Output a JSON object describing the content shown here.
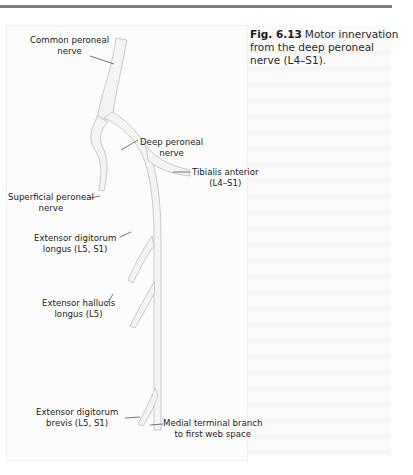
{
  "figure": {
    "number": "Fig. 6.13",
    "caption": "Motor innervation from the deep peroneal nerve (L4–S1)."
  },
  "labels": {
    "common_peroneal": [
      "Common peroneal",
      "nerve"
    ],
    "deep_peroneal": [
      "Deep peroneal",
      "nerve"
    ],
    "tibialis_anterior": [
      "Tibialis anterior",
      "(L4–S1)"
    ],
    "superficial_peroneal": [
      "Superficial peroneal",
      "nerve"
    ],
    "edl": [
      "Extensor digitorum",
      "longus (L5, S1)"
    ],
    "ehl": [
      "Extensor hallucis",
      "longus (L5)"
    ],
    "edb": [
      "Extensor digitorum",
      "brevis (L5, S1)"
    ],
    "medial_terminal": [
      "Medial terminal branch",
      "to first web space"
    ]
  },
  "colors": {
    "nerve_fill": "#f4f4f4",
    "nerve_edge": "#c8c8c8",
    "leader": "#555555",
    "rule": "#7d7d7d"
  }
}
